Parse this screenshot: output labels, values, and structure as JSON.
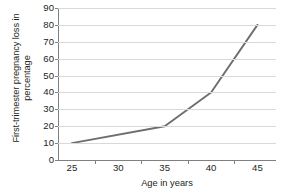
{
  "chart_data": {
    "type": "line",
    "title": "",
    "xlabel": "Age in years",
    "ylabel": "First-trimester pregnancy loss in percentage",
    "ylabel_line1": "First-trimester pregnancy loss in",
    "ylabel_line2": "percentage",
    "x": [
      25,
      30,
      35,
      40,
      45
    ],
    "values": [
      10,
      15,
      20,
      40,
      80
    ],
    "xtick_labels": [
      "25",
      "30",
      "35",
      "40",
      "45"
    ],
    "ytick_labels": [
      "0",
      "10",
      "20",
      "30",
      "40",
      "50",
      "60",
      "70",
      "80",
      "90"
    ],
    "ytick_values": [
      0,
      10,
      20,
      30,
      40,
      50,
      60,
      70,
      80,
      90
    ],
    "xlim": [
      23.5,
      47
    ],
    "ylim": [
      0,
      90
    ],
    "grid": "horizontal",
    "legend": "none",
    "series": [
      {
        "name": "First-trimester pregnancy loss",
        "points": [
          {
            "x": 25,
            "y": 10
          },
          {
            "x": 35,
            "y": 20
          },
          {
            "x": 40,
            "y": 40
          },
          {
            "x": 45,
            "y": 80
          }
        ]
      }
    ],
    "colors": {
      "line": "#6d6e71",
      "grid": "#d9d9d9",
      "axis": "#808080",
      "text": "#231f20",
      "background": "#ffffff"
    }
  }
}
